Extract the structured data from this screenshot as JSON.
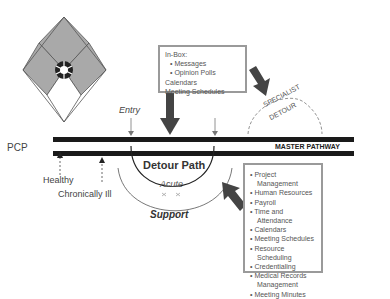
{
  "labels": {
    "pcp": "PCP",
    "healthy": "Healthy",
    "chronically_ill": "Chronically Ill",
    "entry": "Entry",
    "detour_path": "Detour Path",
    "acute": "Acute",
    "support": "Support",
    "master_pathway": "MASTER PATHWAY",
    "specialist_detour_line1": "SPECIALIST",
    "specialist_detour_line2": "DETOUR"
  },
  "inbox_box": {
    "title": "In-Box:",
    "items": [
      {
        "text": "• Messages",
        "indent": true
      },
      {
        "text": "• Opinion Polls",
        "indent": true
      },
      {
        "text": "Calendars",
        "indent": false
      },
      {
        "text": "Meeting Schedules",
        "indent": false
      }
    ]
  },
  "services_box": {
    "items": [
      "• Project Management",
      "• Human Resources",
      "• Payroll",
      "• Time and Attendance",
      "• Calendars",
      "• Meeting Schedules",
      "• Resource Scheduling",
      "• Credentialing",
      "• Medical Records",
      "Management",
      "• Meeting Minutes"
    ]
  },
  "colors": {
    "pathway": "#1a1a1a",
    "diamond_fill": "#a9a9a9",
    "arrow_fill": "#444444",
    "box_border": "#9a9a9a"
  }
}
